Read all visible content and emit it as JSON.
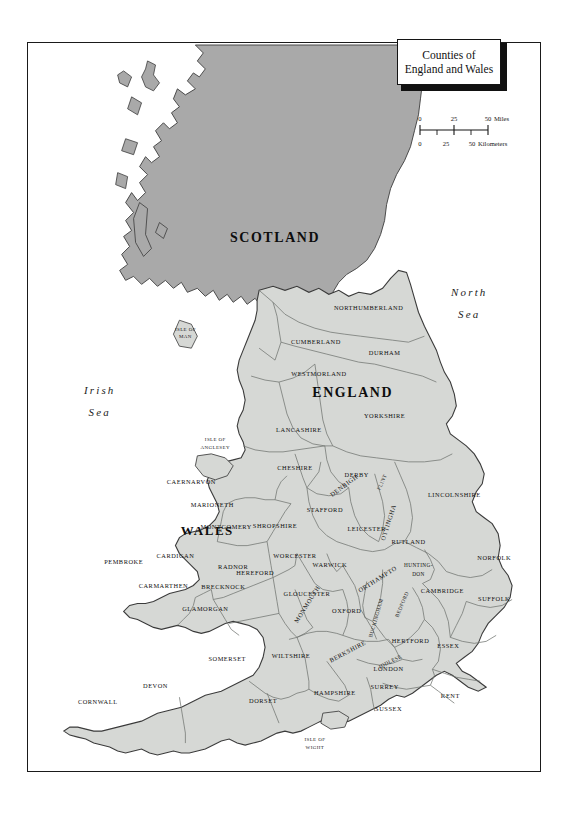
{
  "document": {
    "title": "Counties of England and Wales",
    "title_lines": [
      "Counties of",
      "England and Wales"
    ]
  },
  "scale": {
    "miles": {
      "ticks": [
        "0",
        "25",
        "50"
      ],
      "unit": "Miles"
    },
    "kilometers": {
      "ticks": [
        "0",
        "25",
        "50"
      ],
      "unit": "Kilometers"
    }
  },
  "seas": [
    {
      "id": "irish-sea",
      "lines": [
        "Irish",
        "Sea"
      ]
    },
    {
      "id": "north-sea",
      "lines": [
        "North",
        "Sea"
      ]
    }
  ],
  "countries": [
    {
      "id": "scotland",
      "label": "SCOTLAND"
    },
    {
      "id": "england",
      "label": "ENGLAND"
    },
    {
      "id": "wales",
      "label": "WALES"
    }
  ],
  "islands": [
    {
      "id": "isle-of-man",
      "lines": [
        "ISLE OF",
        "MAN"
      ]
    },
    {
      "id": "isle-of-wight",
      "lines": [
        "ISLE OF",
        "WIGHT"
      ]
    },
    {
      "id": "isle-of-anglesey",
      "lines": [
        "ISLE OF",
        "ANGLESEY"
      ]
    }
  ],
  "counties": [
    {
      "id": "northumberland",
      "label": "NORTHUMBERLAND"
    },
    {
      "id": "cumberland",
      "label": "CUMBERLAND"
    },
    {
      "id": "durham",
      "label": "DURHAM"
    },
    {
      "id": "westmorland",
      "label": "WESTMORLAND"
    },
    {
      "id": "yorkshire",
      "label": "YORKSHIRE"
    },
    {
      "id": "lancashire",
      "label": "LANCASHIRE"
    },
    {
      "id": "cheshire",
      "label": "CHESHIRE"
    },
    {
      "id": "derby",
      "label": "DERBY"
    },
    {
      "id": "nottingham",
      "label": "NOTTINGHAM"
    },
    {
      "id": "lincolnshire",
      "label": "LINCOLNSHIRE"
    },
    {
      "id": "stafford",
      "label": "STAFFORD"
    },
    {
      "id": "shropshire",
      "label": "SHROPSHIRE"
    },
    {
      "id": "leicester",
      "label": "LEICESTER"
    },
    {
      "id": "rutland",
      "label": "RUTLAND"
    },
    {
      "id": "norfolk",
      "label": "NORFOLK"
    },
    {
      "id": "suffolk",
      "label": "SUFFOLK"
    },
    {
      "id": "cambridge",
      "label": "CAMBRIDGE"
    },
    {
      "id": "huntingdon",
      "lines": [
        "HUNTING-",
        "DON"
      ]
    },
    {
      "id": "northampton",
      "label": "NORTHAMPTON"
    },
    {
      "id": "bedford",
      "label": "BEDFORD"
    },
    {
      "id": "buckingham",
      "label": "BUCKINGHAM"
    },
    {
      "id": "hertford",
      "label": "HERTFORD"
    },
    {
      "id": "essex",
      "label": "ESSEX"
    },
    {
      "id": "middlesex",
      "label": "MIDDLESEX"
    },
    {
      "id": "london",
      "label": "LONDON"
    },
    {
      "id": "surrey",
      "label": "SURREY"
    },
    {
      "id": "kent",
      "label": "KENT"
    },
    {
      "id": "sussex",
      "label": "SUSSEX"
    },
    {
      "id": "hampshire",
      "label": "HAMPSHIRE"
    },
    {
      "id": "berkshire",
      "label": "BERKSHIRE"
    },
    {
      "id": "oxford",
      "label": "OXFORD"
    },
    {
      "id": "warwick",
      "label": "WARWICK"
    },
    {
      "id": "worcester",
      "label": "WORCESTER"
    },
    {
      "id": "gloucester",
      "label": "GLOUCESTER"
    },
    {
      "id": "wiltshire",
      "label": "WILTSHIRE"
    },
    {
      "id": "somerset",
      "label": "SOMERSET"
    },
    {
      "id": "dorset",
      "label": "DORSET"
    },
    {
      "id": "devon",
      "label": "DEVON"
    },
    {
      "id": "cornwall",
      "label": "CORNWALL"
    },
    {
      "id": "hereford",
      "label": "HEREFORD"
    },
    {
      "id": "monmouth",
      "label": "MONMOUTH"
    },
    {
      "id": "glamorgan",
      "label": "GLAMORGAN"
    },
    {
      "id": "brecknock",
      "label": "BRECKNOCK"
    },
    {
      "id": "carmarthen",
      "label": "CARMARTHEN"
    },
    {
      "id": "pembroke",
      "label": "PEMBROKE"
    },
    {
      "id": "cardigan",
      "label": "CARDIGAN"
    },
    {
      "id": "radnor",
      "label": "RADNOR"
    },
    {
      "id": "montgomery",
      "label": "MONTGOMERY"
    },
    {
      "id": "marioneth",
      "label": "MARIONETH"
    },
    {
      "id": "caernarvon",
      "label": "CAERNARVON"
    },
    {
      "id": "denbigh",
      "label": "DENBIGH"
    },
    {
      "id": "flint",
      "label": "FLINT"
    }
  ],
  "colors": {
    "page_background": "#ffffff",
    "england_wales_fill": "#d6d8d5",
    "scotland_fill": "#a9a9a9",
    "county_border": "#6f7370",
    "coastline": "#3b3b3b",
    "frame": "#1a1a1a",
    "text": "#101010"
  }
}
